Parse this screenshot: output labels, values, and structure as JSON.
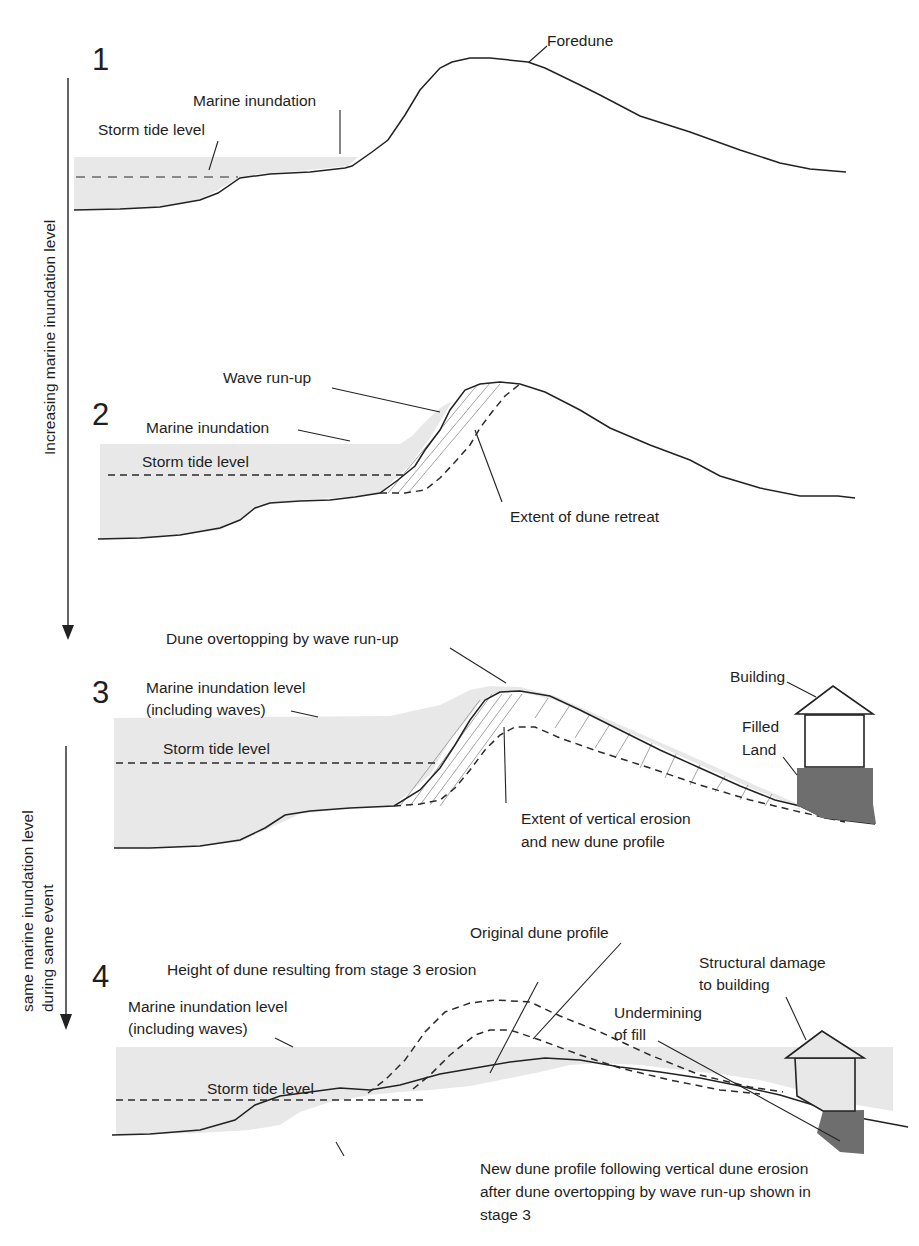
{
  "figure": {
    "type": "schematic cross-section diagram",
    "stages": [
      {
        "number": "1",
        "labels": {
          "foredune": "Foredune",
          "marine_inundation": "Marine inundation",
          "storm_tide_level": "Storm tide level"
        }
      },
      {
        "number": "2",
        "labels": {
          "wave_run_up": "Wave run-up",
          "marine_inundation": "Marine inundation",
          "storm_tide_level": "Storm tide level",
          "extent_of_dune_retreat": "Extent of dune retreat"
        }
      },
      {
        "number": "3",
        "labels": {
          "dune_overtopping": "Dune overtopping by wave run-up",
          "marine_inundation_line1": "Marine inundation level",
          "marine_inundation_line2": "(including waves)",
          "storm_tide_level": "Storm tide level",
          "building": "Building",
          "filled_land_line1": "Filled",
          "filled_land_line2": "Land",
          "vertical_erosion_line1": "Extent of vertical erosion",
          "vertical_erosion_line2": "and new dune profile"
        }
      },
      {
        "number": "4",
        "labels": {
          "original_dune_profile": "Original dune profile",
          "height_of_dune": "Height of dune resulting from stage 3 erosion",
          "structural_damage_line1": "Structural damage",
          "structural_damage_line2": "to building",
          "undermining_line1": "Undermining",
          "undermining_line2": "of fill",
          "marine_inundation_line1": "Marine inundation level",
          "marine_inundation_line2": "(including waves)",
          "storm_tide_level": "Storm tide level",
          "new_profile_line1": "New dune profile following vertical dune erosion",
          "new_profile_line2": "after dune overtopping by wave run-up shown in",
          "new_profile_line3": "stage 3"
        }
      }
    ],
    "side_arrows": {
      "increasing": "Increasing marine inundation level",
      "same_line1": "same marine inundation level",
      "same_line2": "during same event"
    },
    "colors": {
      "water_fill": "#e8e8e8",
      "fill_land": "#6e6e6e",
      "line": "#222222"
    }
  }
}
